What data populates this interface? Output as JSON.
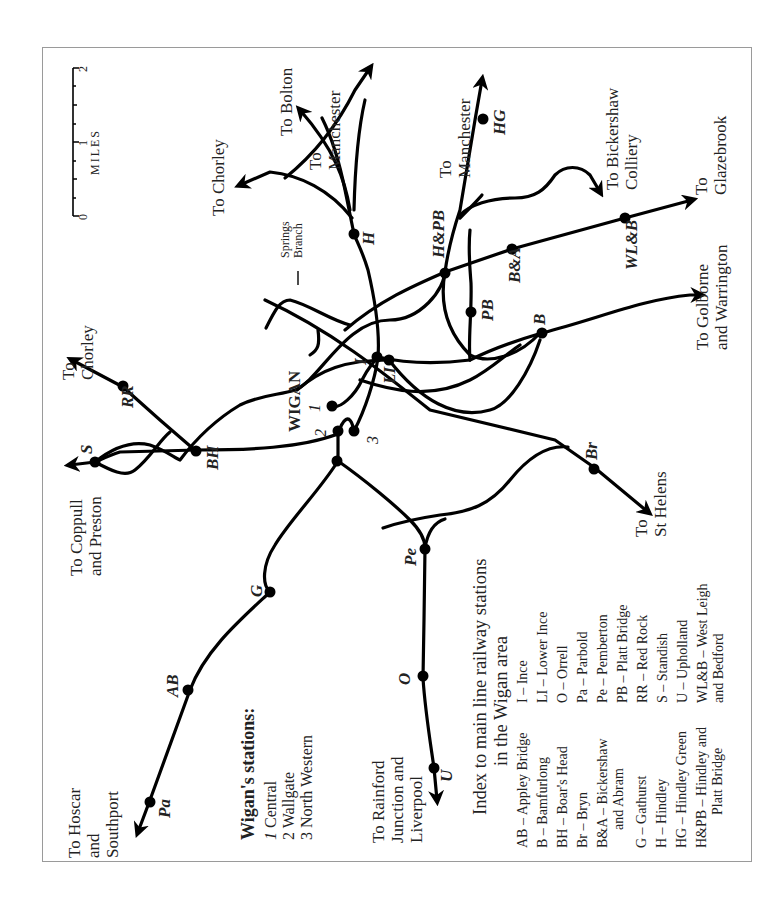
{
  "map": {
    "orientation": "rotated 90 degrees counter-clockwise",
    "town_label": "WIGAN",
    "scale": {
      "unit_label": "MILES",
      "ticks": [
        "0",
        "1",
        "2"
      ]
    },
    "destinations": {
      "hoscar": [
        "To Hoscar",
        "and",
        "Southport"
      ],
      "coppull": [
        "To Coppull",
        "and Preston"
      ],
      "chorley_west": [
        "To",
        "Chorley"
      ],
      "chorley_north": "To Chorley",
      "bolton": "To Bolton",
      "manchester_1": [
        "To",
        "Manchester"
      ],
      "manchester_2": [
        "To",
        "Manchester"
      ],
      "bickershaw": [
        "To Bickershaw",
        "Colliery"
      ],
      "glazebrook": [
        "To",
        "Glazebrook"
      ],
      "golborne": [
        "To Golborne",
        "and Warrington"
      ],
      "st_helens": [
        "To",
        "St Helens"
      ],
      "rainford": [
        "To Rainford",
        "Junction and",
        "Liverpool"
      ]
    },
    "springs_branch": [
      "Springs",
      "Branch"
    ],
    "station_codes": {
      "Pa": "Pa",
      "AB": "AB",
      "G": "G",
      "O": "O",
      "U": "U",
      "Pe": "Pe",
      "S": "S",
      "RR": "RR",
      "BH": "BH",
      "Br": "Br",
      "B": "B",
      "PB": "PB",
      "BA": "B&A",
      "WLB": "WL&B",
      "HPB": "H&PB",
      "H": "H",
      "HG": "HG",
      "I": "I",
      "LI": "LI"
    },
    "wigan_station_numbers": {
      "n1": "1",
      "n2": "2",
      "n3": "3"
    }
  },
  "wigan_stations": {
    "title": "Wigan's stations:",
    "items": [
      {
        "num": "1",
        "name": "Central"
      },
      {
        "num": "2",
        "name": "Wallgate"
      },
      {
        "num": "3",
        "name": "North Western"
      }
    ]
  },
  "index": {
    "title_line1": "Index to main line railway stations",
    "title_line2": "in the Wigan area",
    "column1": [
      "AB – Appley Bridge",
      "B – Bamfurlong",
      "BH – Boar's Head",
      "Br – Bryn",
      "B&A – Bickershaw",
      "and Abram",
      "G – Gathurst",
      "H – Hindley",
      "HG – Hindley Green",
      "H&PB – Hindley and",
      "Platt Bridge"
    ],
    "column2": [
      "I – Ince",
      "LI – Lower Ince",
      "O – Orrell",
      "Pa – Parbold",
      "Pe – Pemberton",
      "PB – Platt Bridge",
      "RR – Red Rock",
      "S – Standish",
      "U – Upholland",
      "WL&B – West Leigh",
      "and Bedford"
    ]
  }
}
